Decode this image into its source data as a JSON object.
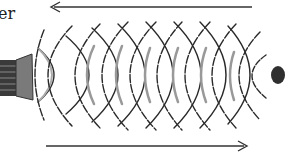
{
  "diagram": {
    "title_label": "er",
    "source": {
      "name": "speaker",
      "color": "#7a7a7a"
    },
    "target": {
      "name": "object",
      "color": "#2f2f2f"
    },
    "arrows": [
      {
        "name": "reflected-direction-arrow",
        "direction": "left",
        "y": 7,
        "x1": 252,
        "x2": 50
      },
      {
        "name": "outgoing-direction-arrow",
        "direction": "right",
        "y": 146,
        "x1": 46,
        "x2": 248
      }
    ],
    "outgoing_wave_count": 9,
    "reflected_wave_count": 9,
    "colors": {
      "stroke": "#2a2a2a",
      "shade": "#9a9a9a"
    }
  }
}
